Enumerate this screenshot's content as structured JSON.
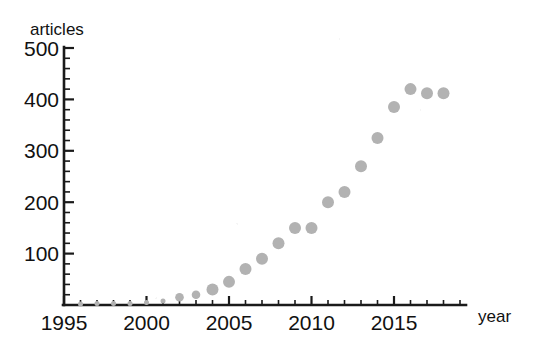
{
  "chart_data": {
    "type": "scatter",
    "title": "",
    "subtitle": "",
    "xlabel": "year",
    "ylabel": "articles",
    "xlim": [
      1995,
      2019
    ],
    "ylim": [
      0,
      500
    ],
    "grid": false,
    "legend": null,
    "marker": {
      "shape": "circle",
      "color": "#b2b2b2",
      "size_small": 2.5,
      "size_large": 6
    },
    "x_ticks_major": [
      1995,
      2000,
      2005,
      2010,
      2015
    ],
    "x_tick_labels": [
      "1995",
      "2000",
      "2005",
      "2010",
      "2015"
    ],
    "x_ticks_minor_step": 1,
    "y_ticks_major": [
      100,
      200,
      300,
      400,
      500
    ],
    "y_tick_labels": [
      "100",
      "200",
      "300",
      "400",
      "500"
    ],
    "y_ticks_minor_step": 20,
    "x": [
      1996,
      1997,
      1998,
      1999,
      2000,
      2001,
      2002,
      2003,
      2004,
      2005,
      2006,
      2007,
      2008,
      2009,
      2010,
      2011,
      2012,
      2013,
      2014,
      2015,
      2016,
      2017,
      2018
    ],
    "values": [
      2,
      3,
      3,
      3,
      5,
      8,
      15,
      20,
      30,
      45,
      70,
      90,
      120,
      150,
      150,
      200,
      220,
      270,
      325,
      385,
      420,
      412,
      412
    ],
    "series": [
      {
        "name": "articles",
        "values": [
          2,
          3,
          3,
          3,
          5,
          8,
          15,
          20,
          30,
          45,
          70,
          90,
          120,
          150,
          150,
          200,
          220,
          270,
          325,
          385,
          420,
          412,
          412
        ]
      }
    ],
    "annotations": []
  },
  "axes": {
    "y_axis_title": "articles",
    "x_axis_title": "year"
  }
}
